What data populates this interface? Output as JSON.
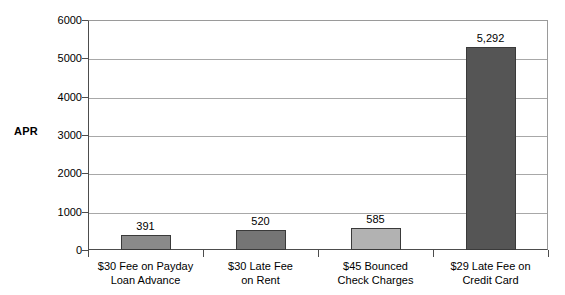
{
  "chart_data": {
    "type": "bar",
    "title": "",
    "subtitle": "",
    "xlabel": "",
    "ylabel": "APR",
    "ylim": [
      0,
      6000
    ],
    "grid": true,
    "legend": "none",
    "categories": [
      "$30 Fee on Payday Loan Advance",
      "$30 Late Fee on Rent",
      "$45 Bounced Check Charges",
      "$29 Late Fee on Credit Card"
    ],
    "category_lines": [
      [
        "$30 Fee on Payday",
        "Loan Advance"
      ],
      [
        "$30 Late Fee",
        "on Rent"
      ],
      [
        "$45 Bounced",
        "Check Charges"
      ],
      [
        "$29 Late Fee on",
        "Credit Card"
      ]
    ],
    "values": [
      391,
      520,
      585,
      5292
    ],
    "value_labels": [
      "391",
      "520",
      "585",
      "5,292"
    ],
    "bar_colors": [
      "#8a8a8a",
      "#757575",
      "#b2b2b2",
      "#555555"
    ],
    "bar_border_color": "#3a3a3a",
    "yticks": [
      0,
      1000,
      2000,
      3000,
      4000,
      5000,
      6000
    ],
    "ytick_labels": [
      "0",
      "1000",
      "2000",
      "3000",
      "4000",
      "5000",
      "6000"
    ],
    "axis_color": "#4d4d4d",
    "grid_color": "#a8a8a8",
    "background": "#ffffff"
  },
  "axis": {
    "y_title": "APR"
  }
}
